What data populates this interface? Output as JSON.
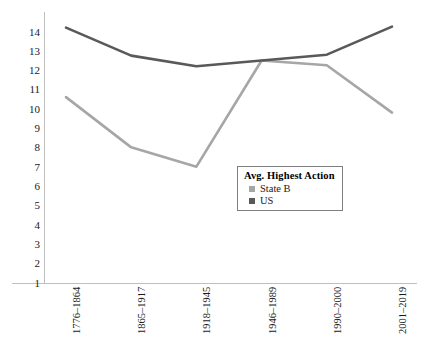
{
  "chart_data": {
    "type": "line",
    "title": "",
    "xlabel": "",
    "ylabel": "",
    "categories": [
      "1776–1864",
      "1865–1917",
      "1918–1945",
      "1946–1989",
      "1990–2000",
      "2001–2019"
    ],
    "series": [
      {
        "name": "State B",
        "values": [
          10.6,
          8.0,
          7.0,
          12.5,
          12.25,
          9.8
        ],
        "color": "#a6a6a6"
      },
      {
        "name": "US",
        "values": [
          14.2,
          12.75,
          12.2,
          12.5,
          12.8,
          14.25
        ],
        "color": "#595959"
      }
    ],
    "ylim": [
      0,
      14.6
    ],
    "yticks": [
      14,
      13,
      12,
      11,
      10,
      9,
      8,
      7,
      6,
      5,
      4,
      3,
      2,
      1
    ],
    "ytick_labels": [
      "14",
      "13",
      "12",
      "11",
      "10",
      "9",
      "8",
      "7",
      "6",
      "5",
      "4",
      "3",
      "2",
      "1"
    ],
    "grid": false,
    "legend_position": "center-right"
  },
  "legend": {
    "title": "Avg. Highest Action",
    "entries": [
      {
        "label": "State B",
        "color": "#a6a6a6"
      },
      {
        "label": "US",
        "color": "#595959"
      }
    ]
  },
  "axes": {
    "y_tick_labels": [
      "14",
      "13",
      "12",
      "11",
      "10",
      "9",
      "8",
      "7",
      "6",
      "5",
      "4",
      "3",
      "2",
      "1"
    ],
    "x_tick_labels": [
      "1776–1864",
      "1865–1917",
      "1918–1945",
      "1946–1989",
      "1990–2000",
      "2001–2019"
    ]
  },
  "colors": {
    "series_state_b": "#a6a6a6",
    "series_us": "#595959",
    "axis_line": "#bfbfbf",
    "text": "#1a1a1a",
    "background": "#ffffff"
  }
}
